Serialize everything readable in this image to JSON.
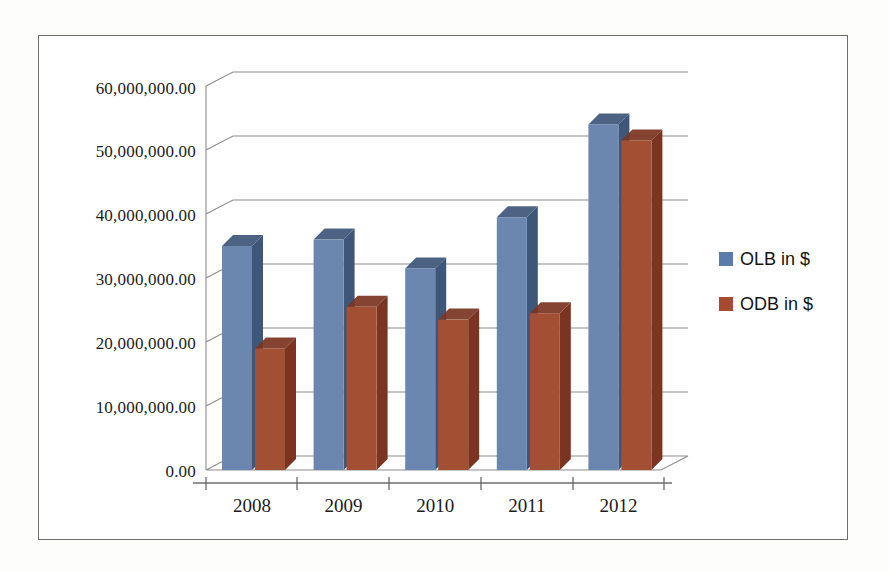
{
  "chart_data": {
    "type": "bar",
    "title": "",
    "subtitle": "",
    "xlabel": "",
    "ylabel": "",
    "categories": [
      "2008",
      "2009",
      "2010",
      "2011",
      "2012"
    ],
    "series": [
      {
        "name": "OLB in $",
        "color": "#6b87b0",
        "side_color": "#3d5679",
        "top_color": "#51699247",
        "values": [
          35000000,
          36000000,
          31500000,
          39500000,
          54000000
        ]
      },
      {
        "name": "ODB in $",
        "color": "#a34f33",
        "side_color": "#7a3420",
        "top_color": "#b8653f",
        "values": [
          19000000,
          25500000,
          23500000,
          24500000,
          51500000
        ]
      }
    ],
    "ylim": [
      0,
      60000000
    ],
    "ytick_values": [
      0,
      10000000,
      20000000,
      30000000,
      40000000,
      50000000,
      60000000
    ],
    "ytick_labels": [
      "0.00",
      "10,000,000.00",
      "20,000,000.00",
      "30,000,000.00",
      "40,000,000.00",
      "50,000,000.00",
      "60,000,000.00"
    ],
    "grid": true,
    "legend_position": "right",
    "three_d": true
  },
  "legend": {
    "items": [
      {
        "label": "OLB in $",
        "color": "#5b7ba8",
        "swatch_name": "legend-swatch-olb"
      },
      {
        "label": "ODB in $",
        "color": "#a64a32",
        "swatch_name": "legend-swatch-odb"
      }
    ]
  },
  "frame": {
    "border_color": "#6e6e6e",
    "background": "#ffffff"
  }
}
